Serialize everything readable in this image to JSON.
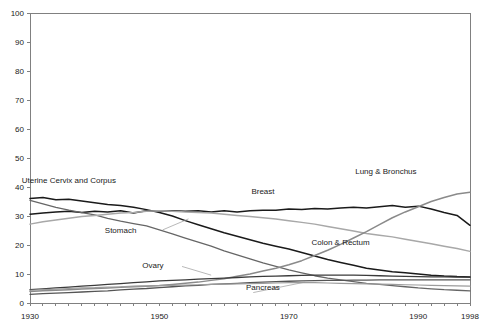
{
  "chart_data": {
    "type": "line",
    "title": "",
    "xlabel": "",
    "ylabel": "",
    "xlim": [
      1930,
      1998
    ],
    "ylim": [
      0,
      100
    ],
    "ytick_values": [
      0,
      10,
      20,
      30,
      40,
      50,
      60,
      70,
      80,
      90,
      100
    ],
    "ytick_labels": [
      "0",
      "10",
      "20",
      "30",
      "40",
      "50",
      "60",
      "70",
      "80",
      "90",
      "100"
    ],
    "xtick_labels": [
      "1930",
      "1950",
      "1970",
      "1990",
      "1998"
    ],
    "xtick_values": [
      1930,
      1950,
      1970,
      1990,
      1998
    ],
    "minor_tick_interval": 2,
    "grid": false,
    "legend": "inline-annotations",
    "x": [
      1930,
      1932,
      1934,
      1936,
      1938,
      1940,
      1942,
      1944,
      1946,
      1948,
      1950,
      1952,
      1954,
      1956,
      1958,
      1960,
      1962,
      1964,
      1966,
      1968,
      1970,
      1972,
      1974,
      1976,
      1978,
      1980,
      1982,
      1984,
      1986,
      1988,
      1990,
      1992,
      1994,
      1996,
      1998
    ],
    "series": [
      {
        "name": "Uterine Cervix and Corpus",
        "color": "#1a1a1a",
        "width": 1.5,
        "label_x": 1936,
        "label_y": 41.5,
        "values": [
          36.0,
          36.4,
          35.6,
          35.8,
          35.2,
          34.6,
          34.0,
          33.6,
          33.0,
          32.2,
          31.2,
          30.0,
          28.4,
          27.0,
          25.6,
          24.2,
          23.0,
          21.8,
          20.6,
          19.6,
          18.6,
          17.4,
          16.2,
          15.0,
          14.0,
          13.0,
          12.0,
          11.4,
          10.8,
          10.4,
          10.0,
          9.6,
          9.3,
          9.1,
          9.0
        ]
      },
      {
        "name": "Breast",
        "color": "#1a1a1a",
        "width": 1.5,
        "label_x": 1966,
        "label_y": 37.5,
        "values": [
          30.6,
          31.0,
          31.4,
          31.6,
          31.2,
          31.6,
          31.4,
          31.8,
          31.0,
          31.8,
          31.6,
          31.8,
          31.6,
          31.8,
          31.4,
          31.8,
          31.4,
          31.8,
          32.0,
          32.0,
          32.4,
          32.2,
          32.6,
          32.4,
          32.8,
          33.0,
          32.8,
          33.2,
          33.6,
          33.0,
          33.4,
          32.4,
          31.2,
          30.2,
          26.8
        ]
      },
      {
        "name": "Stomach",
        "color": "#666666",
        "width": 1.3,
        "label_x": 1944,
        "label_y": 24.0,
        "values": [
          35.4,
          34.2,
          33.0,
          32.0,
          31.2,
          30.4,
          29.2,
          28.2,
          27.4,
          26.6,
          25.2,
          23.8,
          22.4,
          21.0,
          19.6,
          18.0,
          16.6,
          15.2,
          13.8,
          12.6,
          11.4,
          10.4,
          9.4,
          8.6,
          8.0,
          7.4,
          6.8,
          6.4,
          6.0,
          5.6,
          5.2,
          4.9,
          4.6,
          4.4,
          4.2
        ]
      },
      {
        "name": "Colon & Rectum",
        "color": "#a8a8a8",
        "width": 1.5,
        "label_x": 1978,
        "label_y": 20.0,
        "values": [
          27.2,
          28.0,
          28.6,
          29.2,
          29.8,
          30.2,
          30.6,
          31.0,
          31.2,
          31.6,
          31.8,
          31.6,
          31.4,
          31.2,
          31.0,
          30.6,
          30.2,
          29.8,
          29.4,
          29.0,
          28.4,
          27.8,
          27.2,
          26.4,
          25.6,
          24.8,
          24.0,
          23.4,
          22.8,
          22.0,
          21.2,
          20.4,
          19.6,
          18.8,
          17.8
        ]
      },
      {
        "name": "Lung & Bronchus",
        "color": "#8a8a8a",
        "width": 1.5,
        "label_x": 1985,
        "label_y": 44.5,
        "values": [
          4.0,
          4.2,
          4.4,
          4.6,
          4.8,
          5.0,
          5.2,
          5.4,
          5.6,
          5.8,
          6.0,
          6.4,
          6.8,
          7.2,
          7.8,
          8.4,
          9.2,
          10.0,
          11.0,
          12.0,
          13.2,
          14.6,
          16.4,
          18.2,
          20.2,
          22.4,
          24.6,
          27.0,
          29.4,
          31.4,
          33.2,
          35.0,
          36.4,
          37.6,
          38.2
        ]
      },
      {
        "name": "Ovary",
        "color": "#3a3a3a",
        "width": 1.3,
        "label_x": 1949,
        "label_y": 12.0,
        "values": [
          4.6,
          4.9,
          5.2,
          5.5,
          5.8,
          6.1,
          6.4,
          6.7,
          7.0,
          7.3,
          7.6,
          7.8,
          8.0,
          8.2,
          8.4,
          8.6,
          8.8,
          9.0,
          9.2,
          9.3,
          9.4,
          9.5,
          9.6,
          9.6,
          9.6,
          9.6,
          9.5,
          9.4,
          9.3,
          9.2,
          9.1,
          9.0,
          9.0,
          8.9,
          8.9
        ]
      },
      {
        "name": "Pancreas",
        "color": "#555555",
        "width": 1.3,
        "label_x": 1966,
        "label_y": 4.4,
        "values": [
          3.0,
          3.2,
          3.4,
          3.6,
          3.8,
          4.0,
          4.2,
          4.5,
          4.8,
          5.0,
          5.3,
          5.6,
          5.9,
          6.1,
          6.4,
          6.6,
          6.8,
          7.0,
          7.2,
          7.4,
          7.5,
          7.6,
          7.7,
          7.8,
          7.8,
          7.9,
          7.9,
          8.0,
          8.0,
          8.0,
          8.0,
          8.0,
          8.0,
          8.0,
          8.0
        ]
      },
      {
        "name": "Uterus other",
        "color": "#9c9c9c",
        "width": 1.2,
        "label_x": null,
        "label_y": null,
        "values": [
          4.4,
          4.6,
          4.8,
          5.0,
          5.2,
          5.3,
          5.5,
          5.6,
          5.8,
          5.9,
          6.0,
          6.1,
          6.2,
          6.3,
          6.4,
          6.5,
          6.6,
          6.7,
          6.8,
          6.9,
          7.0,
          7.0,
          7.0,
          6.9,
          6.8,
          6.7,
          6.6,
          6.5,
          6.4,
          6.3,
          6.2,
          6.1,
          6.0,
          5.9,
          5.8
        ]
      }
    ]
  },
  "plot_geometry": {
    "left": 30,
    "right": 470,
    "top": 13,
    "bottom": 303
  }
}
